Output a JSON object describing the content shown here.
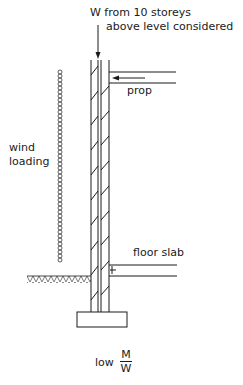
{
  "diagram": {
    "type": "structural-section",
    "labels": {
      "load_line1": "W  from 10 storeys",
      "load_line2": "above level considered",
      "prop": "prop",
      "wind_line1": "wind",
      "wind_line2": "loading",
      "floor_slab": "floor slab",
      "ratio_prefix": "low",
      "ratio_numerator": "M",
      "ratio_denominator": "W"
    },
    "colors": {
      "ink": "#1a1a1a",
      "background": "#ffffff"
    },
    "elements": [
      "wall",
      "vertical-load-arrow",
      "prop",
      "prop-arrow",
      "wind-loading-column",
      "ground-hatch",
      "floor-slab",
      "footing"
    ]
  }
}
